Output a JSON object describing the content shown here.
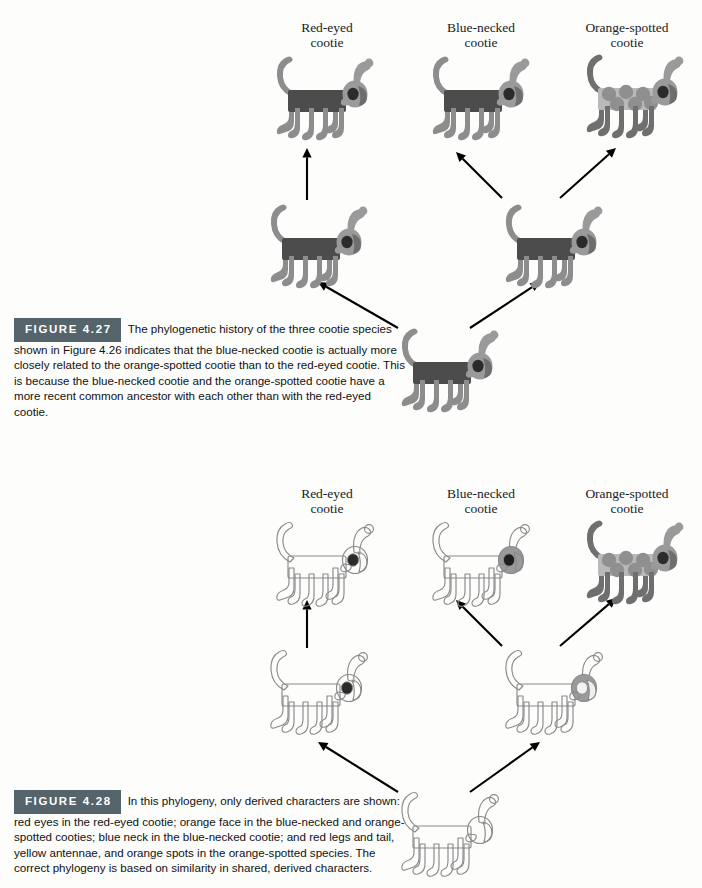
{
  "page": {
    "background": "#fdfdfc",
    "ink": "#1a1a1a"
  },
  "palette": {
    "body_dark": "#4c4c4c",
    "limb_gray": "#8d8d8d",
    "head_gray": "#9a9a9a",
    "spot_gray": "#8f8f8f",
    "spot_body": "#b9b9b9",
    "outline": "#8a8a8a",
    "eye_dark": "#2b2b2b",
    "figure_tag_bg": "#55636b",
    "figure_tag_fg": "#ffffff",
    "arrow": "#000000"
  },
  "figures": [
    {
      "id": "figure-4-27",
      "tag": "FIGURE 4.27",
      "caption_lead": "The phylogenetic history of the three cootie species shown in Figure 4.26 indicates that",
      "caption_rest": "the blue-necked cootie is actually more closely related to the orange-spotted cootie than to the red-eyed cootie. This is because the blue-necked cootie and the orange-spotted cootie have a more recent common ancestor with each other than with the red-eyed cootie.",
      "style": "filled",
      "tip_labels": [
        {
          "line1": "Red-eyed",
          "line2": "cootie",
          "x": 252,
          "y": 20
        },
        {
          "line1": "Blue-necked",
          "line2": "cootie",
          "x": 406,
          "y": 20
        },
        {
          "line1": "Orange-spotted",
          "line2": "cootie",
          "x": 552,
          "y": 20
        }
      ],
      "nodes": [
        {
          "name": "tip-red-eyed",
          "variant": "plain",
          "x": 268,
          "y": 50,
          "scale": 1.0
        },
        {
          "name": "tip-blue-necked",
          "variant": "plain",
          "x": 424,
          "y": 50,
          "scale": 1.0
        },
        {
          "name": "tip-orange-spotted",
          "variant": "spotted",
          "x": 578,
          "y": 48,
          "scale": 1.0
        },
        {
          "name": "ancestor-left",
          "variant": "plain",
          "x": 262,
          "y": 198,
          "scale": 1.0
        },
        {
          "name": "ancestor-right",
          "variant": "plain",
          "x": 497,
          "y": 198,
          "scale": 1.0
        },
        {
          "name": "root-ancestor",
          "variant": "plain",
          "x": 393,
          "y": 322,
          "scale": 1.0
        }
      ],
      "arrows": [
        {
          "name": "arrow-left-to-red-eyed",
          "x1": 307,
          "y1": 200,
          "x2": 307,
          "y2": 148
        },
        {
          "name": "arrow-right-to-blue-necked",
          "x1": 502,
          "y1": 198,
          "x2": 456,
          "y2": 152
        },
        {
          "name": "arrow-right-to-orange",
          "x1": 560,
          "y1": 198,
          "x2": 616,
          "y2": 148
        },
        {
          "name": "arrow-root-to-left",
          "x1": 398,
          "y1": 328,
          "x2": 318,
          "y2": 282
        },
        {
          "name": "arrow-root-to-right",
          "x1": 470,
          "y1": 328,
          "x2": 540,
          "y2": 282
        }
      ]
    },
    {
      "id": "figure-4-28",
      "tag": "FIGURE 4.28",
      "caption_lead": "In this phylogeny, only derived characters are shown: red eyes in the red-eyed cootie;",
      "caption_rest": "orange face in the blue-necked and orange-spotted cooties; blue neck in the blue-necked cootie; and red legs and tail, yellow antennae, and orange spots in the orange-spotted species. The correct phylogeny is based on similarity in shared, derived characters.",
      "style": "outline",
      "tip_labels": [
        {
          "line1": "Red-eyed",
          "line2": "cootie",
          "x": 252,
          "y": 486
        },
        {
          "line1": "Blue-necked",
          "line2": "cootie",
          "x": 406,
          "y": 486
        },
        {
          "line1": "Orange-spotted",
          "line2": "cootie",
          "x": 552,
          "y": 486
        }
      ],
      "nodes": [
        {
          "name": "tip-red-eyed",
          "variant": "outline-eye",
          "x": 268,
          "y": 516,
          "scale": 1.0
        },
        {
          "name": "tip-blue-necked",
          "variant": "outline-neck",
          "x": 424,
          "y": 516,
          "scale": 1.0
        },
        {
          "name": "tip-orange-spotted",
          "variant": "spotted",
          "x": 578,
          "y": 514,
          "scale": 1.0
        },
        {
          "name": "ancestor-left",
          "variant": "outline-eye",
          "x": 262,
          "y": 644,
          "scale": 1.0
        },
        {
          "name": "ancestor-right",
          "variant": "outline-face",
          "x": 497,
          "y": 644,
          "scale": 1.0
        },
        {
          "name": "root-ancestor",
          "variant": "outline-plain",
          "x": 393,
          "y": 786,
          "scale": 1.0
        }
      ],
      "arrows": [
        {
          "name": "arrow-left-to-red-eyed",
          "x1": 307,
          "y1": 648,
          "x2": 307,
          "y2": 600
        },
        {
          "name": "arrow-right-to-blue-necked",
          "x1": 502,
          "y1": 646,
          "x2": 456,
          "y2": 600
        },
        {
          "name": "arrow-right-to-orange",
          "x1": 560,
          "y1": 646,
          "x2": 616,
          "y2": 598
        },
        {
          "name": "arrow-root-to-left",
          "x1": 398,
          "y1": 792,
          "x2": 318,
          "y2": 742
        },
        {
          "name": "arrow-root-to-right",
          "x1": 470,
          "y1": 792,
          "x2": 540,
          "y2": 742
        }
      ]
    }
  ]
}
